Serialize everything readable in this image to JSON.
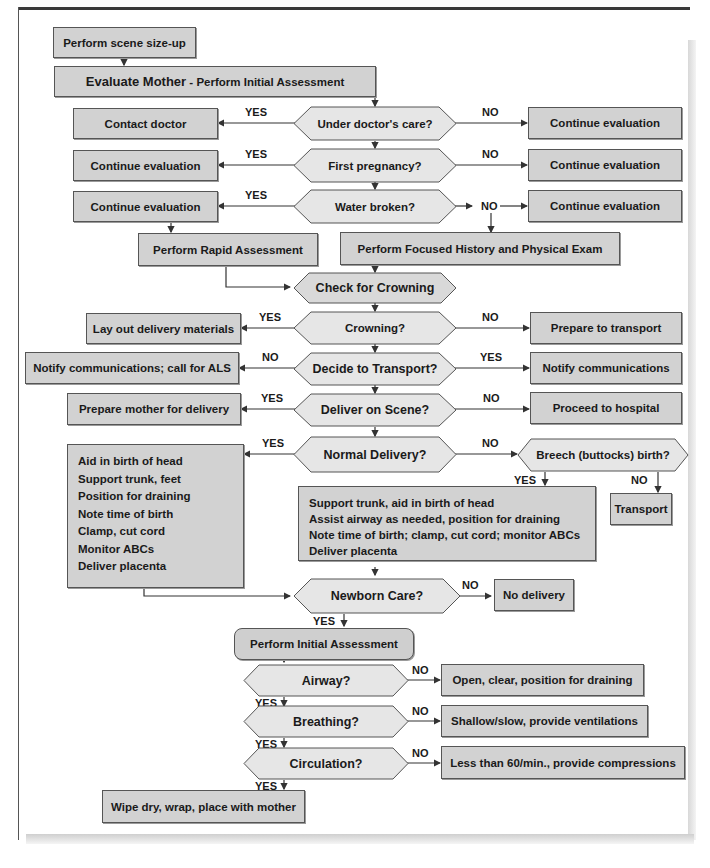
{
  "header": {
    "caption": ""
  },
  "nodes": {
    "scene_sizeup": "Perform scene size-up",
    "evaluate_mother_bold": "Evaluate Mother",
    "evaluate_mother_rest": " - Perform Initial Assessment",
    "q_doctor": "Under doctor's care?",
    "contact_doctor": "Contact doctor",
    "continue_1": "Continue evaluation",
    "q_first_pregnancy": "First pregnancy?",
    "continue_2_left": "Continue evaluation",
    "continue_2_right": "Continue evaluation",
    "q_water_broken": "Water broken?",
    "continue_3_left": "Continue evaluation",
    "continue_3_right": "Continue evaluation",
    "rapid_assessment": "Perform Rapid Assessment",
    "focused_history": "Perform Focused History and Physical Exam",
    "check_crowning": "Check for Crowning",
    "q_crowning": "Crowning?",
    "lay_out_materials": "Lay out delivery materials",
    "prepare_transport": "Prepare to transport",
    "q_decide_transport": "Decide to Transport?",
    "notify_als": "Notify communications; call for ALS",
    "notify_comm": "Notify communications",
    "q_deliver_scene": "Deliver on Scene?",
    "prepare_mother": "Prepare mother for delivery",
    "proceed_hospital": "Proceed to hospital",
    "q_normal_delivery": "Normal Delivery?",
    "normal_steps": [
      "Aid in birth of head",
      "Support trunk, feet",
      "Position for draining",
      "Note time of birth",
      "Clamp, cut cord",
      "Monitor ABCs",
      "Deliver placenta"
    ],
    "q_breech": "Breech (buttocks) birth?",
    "breech_steps": [
      "Support trunk, aid in birth of head",
      "Assist airway as needed, position for draining",
      "Note time of birth; clamp, cut cord; monitor ABCs",
      "Deliver placenta"
    ],
    "transport": "Transport",
    "q_newborn_care": "Newborn Care?",
    "no_delivery": "No delivery",
    "initial_assessment": "Perform Initial Assessment",
    "q_airway": "Airway?",
    "airway_no": "Open, clear, position for draining",
    "q_breathing": "Breathing?",
    "breathing_no": "Shallow/slow, provide ventilations",
    "q_circulation": "Circulation?",
    "circulation_no": "Less than 60/min., provide compressions",
    "final": "Wipe dry, wrap, place with mother"
  },
  "labels": {
    "yes": "YES",
    "no": "NO"
  },
  "colors": {
    "box_fill": "#d2d2d2",
    "hex_fill": "#e6e6e6",
    "stroke": "#555555",
    "text": "#1a1a1a"
  }
}
